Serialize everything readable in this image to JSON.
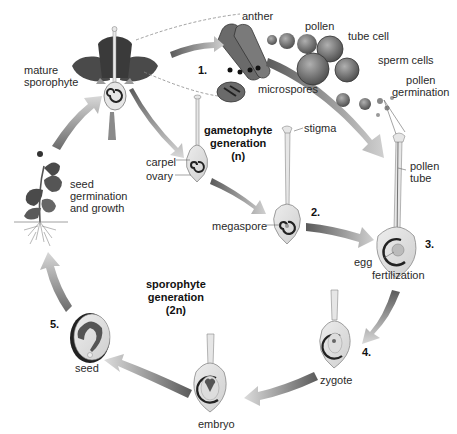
{
  "diagram": {
    "type": "life-cycle",
    "generations": {
      "gametophyte": {
        "title": "gametophyte\ngeneration\n(n)"
      },
      "sporophyte": {
        "title": "sporophyte\ngeneration\n(2n)"
      }
    },
    "steps": [
      "1.",
      "2.",
      "3.",
      "4.",
      "5."
    ],
    "labels": {
      "mature_sporophyte": "mature\nsporophyte",
      "anther": "anther",
      "pollen": "pollen",
      "tube_cell": "tube cell",
      "sperm_cells": "sperm cells",
      "microspores": "microspores",
      "pollen_germination": "pollen\ngermination",
      "stigma": "stigma",
      "carpel": "carpel",
      "ovary": "ovary",
      "megaspore": "megaspore",
      "pollen_tube": "pollen\ntube",
      "egg": "egg",
      "fertilization": "fertilization",
      "zygote": "zygote",
      "embryo": "embryo",
      "seed": "seed",
      "seed_germination": "seed\ngermination\nand growth"
    },
    "colors": {
      "dark_fill": "#3a3a3a",
      "mid_fill": "#7a7a7a",
      "light_fill": "#d9d9d9",
      "arrow_dark": "#5a5a5a",
      "arrow_light": "#d6d6d6",
      "text": "#2a2a2a"
    }
  }
}
